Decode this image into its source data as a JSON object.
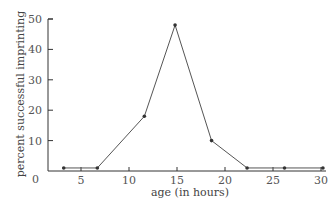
{
  "chart_data": {
    "type": "line",
    "title": "",
    "xlabel": "age (in hours)",
    "ylabel": "percent successful imprinting",
    "x": [
      3.2,
      6.7,
      11.6,
      14.8,
      18.6,
      22.3,
      26.2,
      30.2
    ],
    "series": [
      {
        "name": "imprinting",
        "values": [
          1,
          1,
          18,
          48,
          10,
          1,
          1,
          1
        ]
      }
    ],
    "xticks": [
      5,
      10,
      15,
      20,
      25,
      30
    ],
    "yticks": [
      0,
      10,
      20,
      30,
      40,
      50
    ],
    "xlim": [
      1.8,
      30.5
    ],
    "ylim": [
      0,
      50
    ],
    "grid": false,
    "legend": null,
    "colors": {
      "line": "#555555",
      "marker": "#333333",
      "axis": "#333333"
    }
  }
}
